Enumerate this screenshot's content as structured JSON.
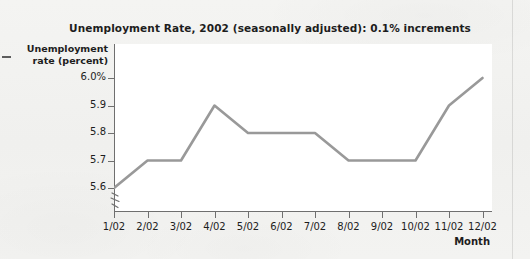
{
  "figure": {
    "title": "Unemployment Rate, 2002 (seasonally adjusted): 0.1% increments",
    "y_axis_title_line1": "Unemployment",
    "y_axis_title_line2": "rate (percent)",
    "x_axis_title": "Month",
    "axis_break_icon": "axis-break-zigzag",
    "line_color": "#999999",
    "axis_color": "#6f6f6f",
    "text_color": "#1d1d1d",
    "plot_background": "#ffffff",
    "page_background": "#f2f2f0"
  },
  "chart_data": {
    "type": "line",
    "title": "Unemployment Rate, 2002 (seasonally adjusted): 0.1% increments",
    "xlabel": "Month",
    "ylabel": "Unemployment rate (percent)",
    "categories": [
      "1/02",
      "2/02",
      "3/02",
      "4/02",
      "5/02",
      "6/02",
      "7/02",
      "8/02",
      "9/02",
      "10/02",
      "11/02",
      "12/02"
    ],
    "values": [
      5.6,
      5.7,
      5.7,
      5.9,
      5.8,
      5.8,
      5.8,
      5.7,
      5.7,
      5.7,
      5.9,
      6.0
    ],
    "ytick_labels": [
      "6.0%",
      "5.9",
      "5.8",
      "5.7",
      "5.6"
    ],
    "ytick_values": [
      6.0,
      5.9,
      5.8,
      5.7,
      5.6
    ],
    "ylim": [
      5.55,
      6.05
    ],
    "y_axis_broken": true,
    "grid": false,
    "legend": false,
    "series": [
      {
        "name": "Unemployment rate",
        "values": [
          5.6,
          5.7,
          5.7,
          5.9,
          5.8,
          5.8,
          5.8,
          5.7,
          5.7,
          5.7,
          5.9,
          6.0
        ]
      }
    ]
  }
}
